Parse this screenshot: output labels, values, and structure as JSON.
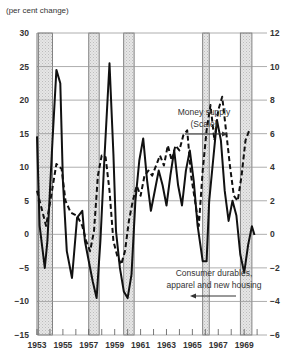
{
  "chart_data": {
    "type": "line",
    "title": "",
    "unit_label": "(per cent change)",
    "xlabel": "",
    "ylabel": "per cent change",
    "xlim": [
      1953,
      1970.3
    ],
    "ylim_left": [
      -15,
      30
    ],
    "ylim_right": [
      -6,
      12
    ],
    "grid": true,
    "y_ticks_left": [
      30,
      25,
      20,
      15,
      10,
      5,
      0,
      -5,
      -10,
      -15
    ],
    "y_ticks_right": [
      12,
      10,
      8,
      6,
      4,
      2,
      0,
      -2,
      -4,
      -6
    ],
    "x_tick_labels": [
      "1953",
      "1955",
      "1957",
      "1959",
      "1961",
      "1963",
      "1965",
      "1967",
      "1969"
    ],
    "shaded_periods": [
      [
        1953.1,
        1954.2
      ],
      [
        1957.0,
        1957.8
      ],
      [
        1959.7,
        1960.5
      ],
      [
        1965.8,
        1966.3
      ],
      [
        1968.7,
        1969.6
      ]
    ],
    "series": [
      {
        "name": "Consumer durables, apparel and new housing",
        "axis": "left",
        "style": "solid",
        "x": [
          1953.0,
          1953.2,
          1953.6,
          1953.8,
          1954.2,
          1954.5,
          1954.8,
          1955.0,
          1955.3,
          1955.7,
          1956.1,
          1956.5,
          1956.7,
          1957.0,
          1957.3,
          1957.6,
          1957.9,
          1958.2,
          1958.6,
          1958.9,
          1959.1,
          1959.4,
          1959.7,
          1960.0,
          1960.3,
          1960.6,
          1960.9,
          1961.2,
          1961.5,
          1961.8,
          1962.1,
          1962.4,
          1962.7,
          1963.0,
          1963.3,
          1963.6,
          1963.9,
          1964.2,
          1964.5,
          1964.8,
          1965.1,
          1965.4,
          1965.8,
          1966.1,
          1966.3,
          1966.6,
          1966.9,
          1967.2,
          1967.5,
          1967.8,
          1968.1,
          1968.4,
          1968.7,
          1969.0,
          1969.3,
          1969.6,
          1969.8
        ],
        "values": [
          14.6,
          1.3,
          -5,
          -1,
          14,
          24.5,
          22.5,
          8,
          -2.5,
          -6.5,
          2.5,
          3.5,
          -1,
          -4,
          -7,
          -9.5,
          -1,
          11,
          25.5,
          12,
          0.5,
          -5,
          -8.5,
          -9.5,
          -6,
          5,
          11,
          14.3,
          8,
          3.5,
          6.5,
          9.5,
          7.3,
          4.3,
          8.8,
          12.5,
          7.3,
          4.3,
          9.5,
          12.5,
          8,
          1.3,
          -4,
          -4,
          5,
          11,
          17,
          14,
          6.5,
          2,
          5,
          2.8,
          -3,
          -5.7,
          -1.6,
          1.2,
          -0.1
        ]
      },
      {
        "name": "Money supply",
        "axis": "right",
        "style": "dashed",
        "x": [
          1953.0,
          1953.4,
          1953.7,
          1954.1,
          1954.5,
          1954.9,
          1955.2,
          1955.6,
          1956.1,
          1956.5,
          1956.8,
          1957.1,
          1957.4,
          1957.7,
          1958.0,
          1958.3,
          1958.6,
          1958.9,
          1959.2,
          1959.5,
          1959.8,
          1960.1,
          1960.4,
          1960.7,
          1961.0,
          1961.3,
          1961.6,
          1961.9,
          1962.2,
          1962.5,
          1962.8,
          1963.1,
          1963.4,
          1963.7,
          1964.0,
          1964.3,
          1964.6,
          1964.9,
          1965.2,
          1965.5,
          1965.8,
          1966.1,
          1966.4,
          1966.7,
          1967.0,
          1967.3,
          1967.6,
          1967.9,
          1968.2,
          1968.5,
          1968.8,
          1969.1,
          1969.4
        ],
        "values": [
          2.6,
          1.4,
          0.5,
          2.3,
          4.2,
          3.9,
          2.0,
          1.3,
          1.1,
          0.5,
          -0.4,
          -1.0,
          0.2,
          3.5,
          4.7,
          4.6,
          2.6,
          -0.4,
          -1.3,
          -1.8,
          -1.0,
          0.8,
          2.0,
          2.9,
          2.3,
          3.5,
          3.8,
          3.5,
          4.1,
          4.7,
          4.1,
          5.3,
          4.4,
          5.3,
          5.0,
          5.9,
          6.2,
          3.5,
          2.0,
          0.5,
          3.8,
          6.2,
          7.7,
          5.6,
          7.4,
          8.2,
          6.2,
          4.1,
          2.3,
          2.0,
          3.5,
          5.6,
          6.2
        ]
      }
    ],
    "annotations": [
      {
        "text": "Money supply",
        "line2": "(Scale)",
        "arrow": "right"
      },
      {
        "text": "Consumer durables,",
        "line2": "apparel and new housing",
        "arrow": "left"
      }
    ]
  },
  "labels": {
    "unit": "(per cent change)",
    "money_line1": "Money supply",
    "money_line2": "(Scale)",
    "consumer_line1": "Consumer durables,",
    "consumer_line2": "apparel and new housing"
  }
}
